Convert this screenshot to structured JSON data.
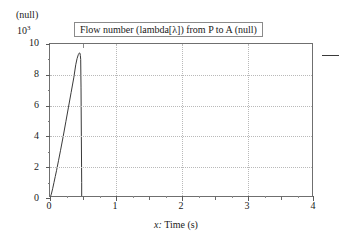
{
  "chart": {
    "title": "Flow number (lambda[λ]) from P to A (null)",
    "unit_label": "(null)",
    "exponent_base": "10",
    "exponent_power": "3",
    "xlabel_prefix": "x:",
    "xlabel": "Time (s)",
    "y_ticks": [
      "0",
      "2",
      "4",
      "6",
      "8",
      "10"
    ],
    "x_ticks": [
      "0",
      "1",
      "2",
      "3",
      "4"
    ],
    "line_color": "#3a3a3a",
    "grid_color": "#b9b9b9",
    "frame_color": "#6f6f6f"
  },
  "chart_data": {
    "type": "line",
    "title": "Flow number (lambda[λ]) from P to A (null)",
    "xlabel": "x: Time (s)",
    "ylabel": "(null)",
    "y_scale_exponent": 3,
    "y_scale_note": "values in units of 10^3",
    "xlim": [
      0,
      4
    ],
    "ylim": [
      0,
      10
    ],
    "xticks": [
      0,
      1,
      2,
      3,
      4
    ],
    "yticks": [
      0,
      2,
      4,
      6,
      8,
      10
    ],
    "x_minor_step": 0.25,
    "grid": true,
    "legend_position": "right-outside",
    "series": [
      {
        "name": "Flow number (lambda[λ]) from P to A",
        "color": "#3a3a3a",
        "x": [
          0.0,
          0.02,
          0.04,
          0.06,
          0.08,
          0.1,
          0.13,
          0.16,
          0.2,
          0.24,
          0.28,
          0.32,
          0.36,
          0.39,
          0.41,
          0.43,
          0.44,
          0.45,
          0.455,
          0.46,
          0.465,
          0.47,
          0.475,
          0.48,
          0.48,
          4.0
        ],
        "y": [
          0.0,
          0.25,
          0.6,
          1.0,
          1.4,
          1.8,
          2.45,
          3.1,
          4.0,
          4.95,
          5.9,
          6.85,
          7.8,
          8.65,
          9.05,
          9.32,
          9.4,
          9.42,
          9.38,
          9.25,
          9.0,
          7.2,
          4.0,
          1.0,
          0.0,
          0.0
        ]
      }
    ]
  }
}
